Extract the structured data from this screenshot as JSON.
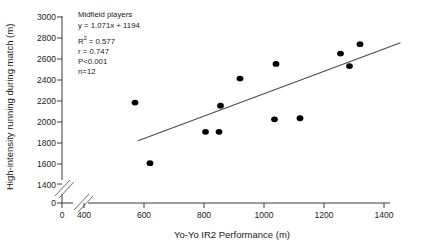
{
  "chart_data": {
    "type": "scatter",
    "title": "",
    "xlabel": "Yo-Yo IR2 Performance (m)",
    "ylabel": "High-intensity running during match (m)",
    "xlim": [
      400,
      1400
    ],
    "ylim": [
      1400,
      3000
    ],
    "x_ticks": [
      "0",
      "400",
      "600",
      "800",
      "1000",
      "1200",
      "1400"
    ],
    "y_ticks": [
      "0",
      "1400",
      "1600",
      "1800",
      "2000",
      "2200",
      "2400",
      "2600",
      "2800",
      "3000"
    ],
    "axis_break_x": true,
    "axis_break_y": true,
    "grid": false,
    "legend": "none",
    "series": [
      {
        "name": "Midfield players",
        "marker": "filled-circle",
        "color": "#000000",
        "points": [
          {
            "x": 570,
            "y": 2180
          },
          {
            "x": 620,
            "y": 1600
          },
          {
            "x": 805,
            "y": 1900
          },
          {
            "x": 850,
            "y": 1900
          },
          {
            "x": 855,
            "y": 2150
          },
          {
            "x": 920,
            "y": 2410
          },
          {
            "x": 1035,
            "y": 2020
          },
          {
            "x": 1040,
            "y": 2550
          },
          {
            "x": 1120,
            "y": 2030
          },
          {
            "x": 1255,
            "y": 2650
          },
          {
            "x": 1285,
            "y": 2530
          },
          {
            "x": 1320,
            "y": 2740
          }
        ]
      }
    ],
    "fit_line": {
      "slope": 1.071,
      "intercept": 1194,
      "x_start": 580,
      "x_end": 1455,
      "color": "#4a4a4a"
    },
    "annotation": {
      "group_label": "Midfield players",
      "equation": "y = 1.071x + 1194",
      "r_squared_prefix": "R",
      "r_squared_sup": "2",
      "r_squared_value": "= 0.577",
      "r_value": "r = 0.747",
      "p_value": "P<0.001",
      "n_value": "n=12"
    }
  }
}
